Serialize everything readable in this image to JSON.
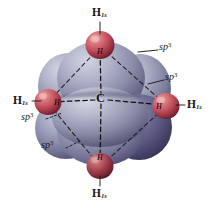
{
  "figure": {
    "background_color": "#ffffff"
  },
  "colors": {
    "orbital_light": "#b9bcd0",
    "orbital_mid": "#8e90ac",
    "orbital_dark": "#4e4a6e",
    "orbital_shadow": "#33304d",
    "hydrogen_light": "#e3868b",
    "hydrogen_mid": "#c04b55",
    "hydrogen_dark": "#7d2030",
    "bond_line": "#1a1a1a",
    "text": "#161616"
  },
  "center_atom": {
    "label": "C",
    "x": 101,
    "y": 99
  },
  "hydrogens": [
    {
      "id": "h-top",
      "label": "H",
      "subscript": "1s",
      "atom_mark": "H",
      "cx": 100,
      "cy": 45,
      "r": 14,
      "label_x": 92,
      "label_y": 8,
      "mark_x": 97,
      "mark_y": 48
    },
    {
      "id": "h-left",
      "label": "H",
      "subscript": "1s",
      "atom_mark": "H",
      "cx": 48,
      "cy": 102,
      "r": 13,
      "label_x": 14,
      "label_y": 96,
      "mark_x": 55,
      "mark_y": 101
    },
    {
      "id": "h-right",
      "label": "H",
      "subscript": "1s",
      "atom_mark": "H",
      "cx": 166,
      "cy": 106,
      "r": 13,
      "label_x": 181,
      "label_y": 101,
      "mark_x": 155,
      "mark_y": 105
    },
    {
      "id": "h-bottom",
      "label": "H",
      "subscript": "1s",
      "atom_mark": "H",
      "cx": 100,
      "cy": 166,
      "r": 13,
      "label_x": 92,
      "label_y": 188,
      "mark_x": 97,
      "mark_y": 155
    }
  ],
  "orbital_labels": [
    {
      "id": "sp3-top-right",
      "text": "sp",
      "superscript": "3",
      "x": 160,
      "y": 46,
      "leader": {
        "x1": 138,
        "y1": 52,
        "x2": 158,
        "y2": 50
      }
    },
    {
      "id": "sp3-right",
      "text": "sp",
      "superscript": "3",
      "x": 166,
      "y": 76,
      "leader": {
        "x1": 148,
        "y1": 84,
        "x2": 164,
        "y2": 80
      }
    },
    {
      "id": "sp3-lower-left",
      "text": "sp",
      "superscript": "3",
      "x": 22,
      "y": 117,
      "leader": {
        "x1": 46,
        "y1": 119,
        "x2": 62,
        "y2": 113
      }
    },
    {
      "id": "sp3-bottom-left",
      "text": "sp",
      "superscript": "3",
      "x": 42,
      "y": 145,
      "leader": {
        "x1": 66,
        "y1": 148,
        "x2": 80,
        "y2": 141
      }
    }
  ],
  "bonds": [
    {
      "id": "bond-c-top",
      "x1": 101,
      "y1": 96,
      "x2": 100,
      "y2": 46
    },
    {
      "id": "bond-c-left",
      "x1": 97,
      "y1": 100,
      "x2": 50,
      "y2": 102
    },
    {
      "id": "bond-c-right",
      "x1": 107,
      "y1": 100,
      "x2": 164,
      "y2": 105
    },
    {
      "id": "bond-c-bottom",
      "x1": 101,
      "y1": 104,
      "x2": 100,
      "y2": 164
    }
  ],
  "tetrahedron_edges": [
    {
      "id": "edge-top-left",
      "x1": 100,
      "y1": 47,
      "x2": 49,
      "y2": 101
    },
    {
      "id": "edge-top-right",
      "x1": 101,
      "y1": 47,
      "x2": 165,
      "y2": 104
    },
    {
      "id": "edge-left-bottom",
      "x1": 49,
      "y1": 104,
      "x2": 99,
      "y2": 165
    },
    {
      "id": "edge-right-bottom",
      "x1": 164,
      "y1": 108,
      "x2": 102,
      "y2": 165
    }
  ]
}
